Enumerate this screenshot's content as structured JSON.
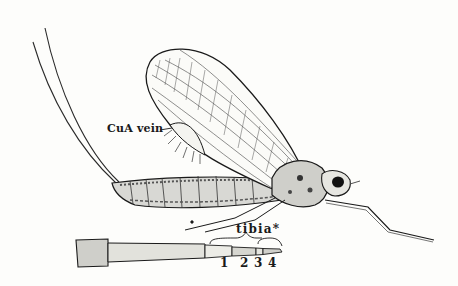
{
  "figure": {
    "colors": {
      "ink": "#1a1a1a",
      "paper": "#fdfdfb"
    }
  },
  "labels": {
    "cua_vein": "CuA vein",
    "tibia": "tibia*",
    "tarsal_segments": [
      "1",
      "2",
      "3",
      "4"
    ]
  },
  "parts": {
    "cerci": "cerci-tails",
    "forewing": "forewing",
    "hindwing_fringe": "CuA vein region with setae",
    "abdomen": "abdomen",
    "thorax": "thorax",
    "head": "head with compound eye",
    "foreleg": "long foreleg",
    "leg_detail": "enlarged leg detail showing tibia and tarsal segments"
  }
}
